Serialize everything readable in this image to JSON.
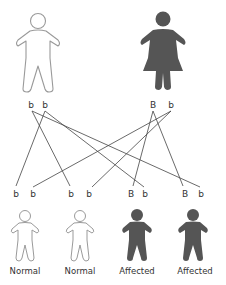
{
  "diagram": {
    "title": "",
    "colors": {
      "normal_outline": "#9a9a9a",
      "normal_fill": "#ffffff",
      "affected_fill": "#555555",
      "line": "#444444",
      "text": "#333333"
    },
    "parents": [
      {
        "id": "father",
        "sex": "male",
        "status": "normal",
        "alleles": [
          "b",
          "b"
        ]
      },
      {
        "id": "mother",
        "sex": "female",
        "status": "affected",
        "alleles": [
          "B",
          "b"
        ]
      }
    ],
    "children": [
      {
        "id": "child1",
        "status_label": "Normal",
        "alleles": [
          "b",
          "b"
        ]
      },
      {
        "id": "child2",
        "status_label": "Normal",
        "alleles": [
          "b",
          "b"
        ]
      },
      {
        "id": "child3",
        "status_label": "Affected",
        "alleles": [
          "B",
          "b"
        ]
      },
      {
        "id": "child4",
        "status_label": "Affected",
        "alleles": [
          "B",
          "b"
        ]
      }
    ],
    "connections": [
      {
        "from": "father.allele1",
        "to": "child2.allele1"
      },
      {
        "from": "father.allele1",
        "to": "child4.allele2"
      },
      {
        "from": "father.allele2",
        "to": "child1.allele1"
      },
      {
        "from": "father.allele2",
        "to": "child3.allele2"
      },
      {
        "from": "mother.allele1",
        "to": "child3.allele1"
      },
      {
        "from": "mother.allele1",
        "to": "child4.allele1"
      },
      {
        "from": "mother.allele2",
        "to": "child1.allele2"
      },
      {
        "from": "mother.allele2",
        "to": "child2.allele2"
      }
    ]
  }
}
